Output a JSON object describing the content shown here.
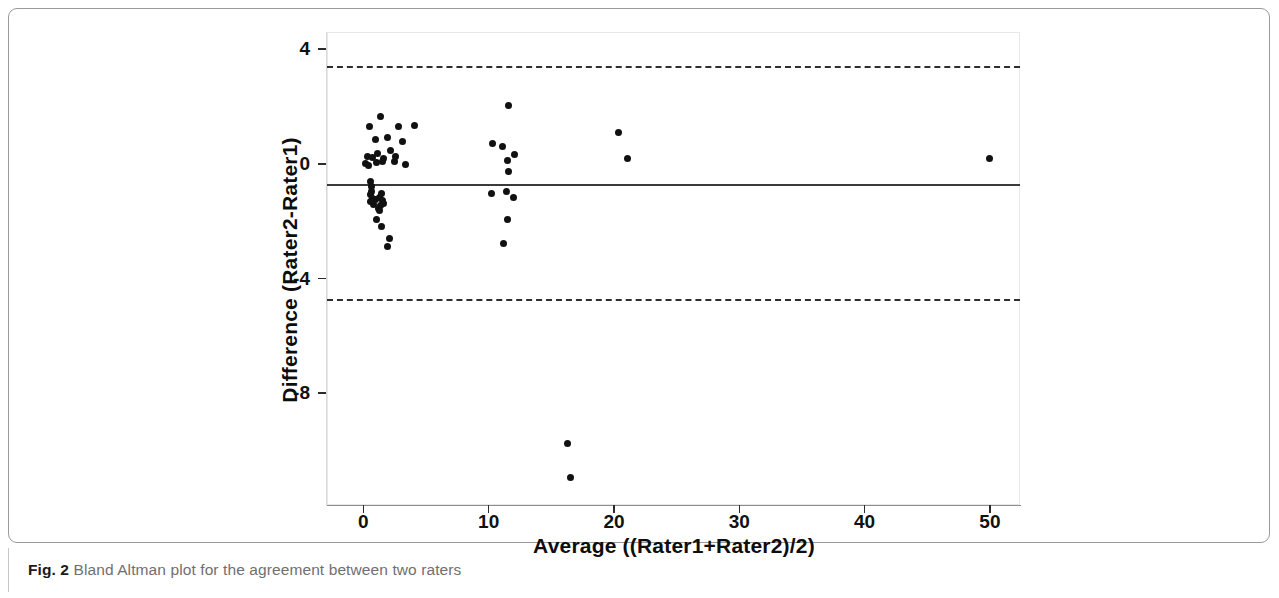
{
  "figure": {
    "caption_label": "Fig. 2",
    "caption_text": " Bland Altman plot for the agreement between two raters"
  },
  "chart_data": {
    "type": "scatter",
    "title": "",
    "subtitle": "",
    "xlabel": "Average ((Rater1+Rater2)/2)",
    "ylabel": "Difference (Rater2-Rater1)",
    "xlim": [
      -2.9,
      52.4
    ],
    "ylim": [
      -11.9,
      4.6
    ],
    "xticks": [
      0,
      10,
      20,
      30,
      40,
      50
    ],
    "xticklabels": [
      "0",
      "10",
      "20",
      "30",
      "40",
      "50"
    ],
    "yticks": [
      4,
      0,
      -4,
      -8
    ],
    "yticklabels": [
      "4",
      "0",
      "-4",
      "-8"
    ],
    "grid": false,
    "legend": "none",
    "reference_lines": [
      {
        "name": "mean-difference",
        "value": -0.71,
        "style": "solid",
        "color": "#3b3b3b"
      },
      {
        "name": "upper-limit-of-agreement",
        "value": 3.42,
        "style": "dashed",
        "color": "#2e2e2e"
      },
      {
        "name": "lower-limit-of-agreement",
        "value": -4.71,
        "style": "dashed",
        "color": "#2e2e2e"
      }
    ],
    "marker": {
      "shape": "circle",
      "color": "#111111",
      "size": 7
    },
    "points": [
      [
        1.4,
        1.66
      ],
      [
        0.5,
        1.32
      ],
      [
        2.8,
        1.29
      ],
      [
        4.1,
        1.33
      ],
      [
        1.0,
        0.86
      ],
      [
        1.9,
        0.92
      ],
      [
        3.1,
        0.79
      ],
      [
        0.3,
        0.27
      ],
      [
        0.75,
        0.23
      ],
      [
        1.1,
        0.35
      ],
      [
        1.6,
        0.2
      ],
      [
        2.2,
        0.46
      ],
      [
        2.6,
        0.25
      ],
      [
        0.15,
        0.02
      ],
      [
        0.45,
        -0.07
      ],
      [
        1.05,
        0.04
      ],
      [
        1.55,
        0.08
      ],
      [
        2.45,
        0.1
      ],
      [
        3.35,
        -0.03
      ],
      [
        0.6,
        -0.62
      ],
      [
        0.62,
        -0.78
      ],
      [
        0.68,
        -0.95
      ],
      [
        0.55,
        -1.08
      ],
      [
        0.72,
        -1.2
      ],
      [
        0.95,
        -1.26
      ],
      [
        1.25,
        -1.18
      ],
      [
        1.45,
        -1.02
      ],
      [
        1.5,
        -1.28
      ],
      [
        1.62,
        -1.38
      ],
      [
        1.35,
        -1.45
      ],
      [
        0.85,
        -1.42
      ],
      [
        0.58,
        -1.33
      ],
      [
        1.18,
        -1.55
      ],
      [
        1.3,
        -1.62
      ],
      [
        1.05,
        -1.95
      ],
      [
        1.45,
        -2.18
      ],
      [
        2.05,
        -2.62
      ],
      [
        1.95,
        -2.88
      ],
      [
        11.6,
        2.02
      ],
      [
        10.3,
        0.72
      ],
      [
        11.1,
        0.6
      ],
      [
        12.1,
        0.32
      ],
      [
        11.5,
        0.12
      ],
      [
        11.55,
        -0.28
      ],
      [
        10.2,
        -1.02
      ],
      [
        11.4,
        -0.98
      ],
      [
        12.0,
        -1.18
      ],
      [
        11.5,
        -1.95
      ],
      [
        11.2,
        -2.78
      ],
      [
        20.4,
        1.08
      ],
      [
        21.1,
        0.18
      ],
      [
        50.0,
        0.18
      ],
      [
        16.3,
        -9.75
      ],
      [
        16.5,
        -10.95
      ]
    ]
  }
}
